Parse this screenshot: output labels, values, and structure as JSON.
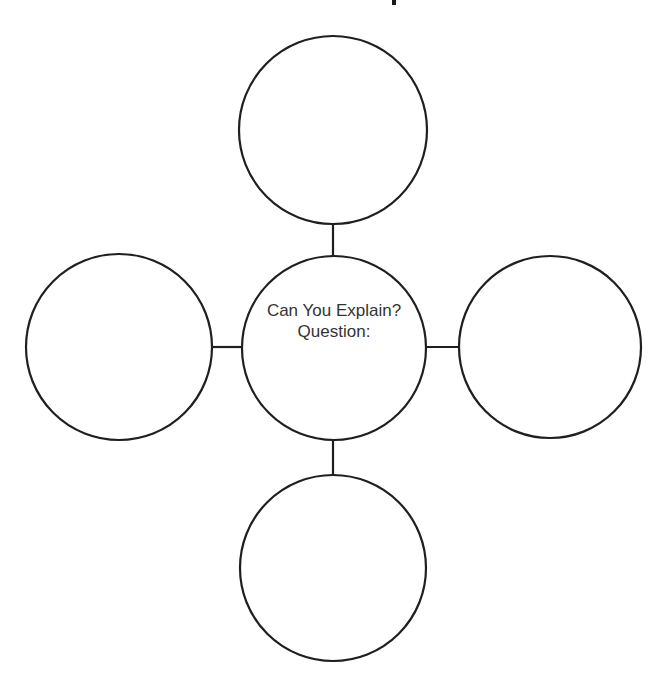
{
  "diagram": {
    "type": "concept-map",
    "stroke_color": "#1f1f1f",
    "background": "#ffffff",
    "center_node": {
      "line1": "Can You Explain?",
      "line2": "Question:",
      "cx": 334,
      "cy": 348,
      "r": 92
    },
    "outer_nodes": [
      {
        "id": "top",
        "label": "",
        "cx": 333,
        "cy": 130,
        "r": 94
      },
      {
        "id": "left",
        "label": "",
        "cx": 119,
        "cy": 347,
        "r": 93
      },
      {
        "id": "right",
        "label": "",
        "cx": 550,
        "cy": 347,
        "r": 91
      },
      {
        "id": "bottom",
        "label": "",
        "cx": 333,
        "cy": 568,
        "r": 93
      }
    ]
  }
}
